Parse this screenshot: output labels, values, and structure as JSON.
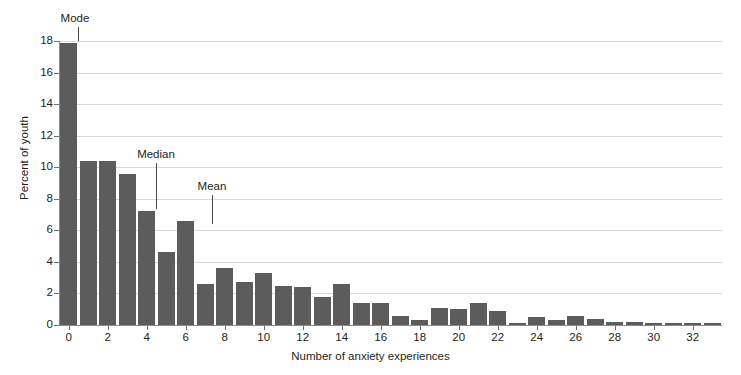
{
  "chart_data": {
    "type": "bar",
    "title": "",
    "xlabel": "Number of anxiety experiences",
    "ylabel": "Percent of youth",
    "categories": [
      0,
      1,
      2,
      3,
      4,
      5,
      6,
      7,
      8,
      9,
      10,
      11,
      12,
      13,
      14,
      15,
      16,
      17,
      18,
      19,
      20,
      21,
      22,
      23,
      24,
      25,
      26,
      27,
      28,
      29,
      30,
      31,
      32,
      33
    ],
    "values": [
      17.9,
      10.4,
      10.4,
      9.6,
      7.2,
      4.6,
      6.6,
      2.6,
      3.6,
      2.7,
      3.3,
      2.5,
      2.4,
      1.8,
      2.6,
      1.4,
      1.4,
      0.6,
      0.3,
      1.1,
      1.0,
      1.4,
      0.9,
      0.1,
      0.5,
      0.3,
      0.6,
      0.35,
      0.2,
      0.2,
      0.15,
      0.15,
      0.15,
      0.12
    ],
    "x_tick_labels": [
      "0",
      "2",
      "4",
      "6",
      "8",
      "10",
      "12",
      "14",
      "16",
      "18",
      "20",
      "22",
      "24",
      "26",
      "28",
      "30",
      "32"
    ],
    "x_tick_values": [
      0,
      2,
      4,
      6,
      8,
      10,
      12,
      14,
      16,
      18,
      20,
      22,
      24,
      26,
      28,
      30,
      32
    ],
    "y_tick_labels": [
      "0",
      "2",
      "4",
      "6",
      "8",
      "10",
      "12",
      "14",
      "16",
      "18"
    ],
    "y_tick_values": [
      0,
      2,
      4,
      6,
      8,
      10,
      12,
      14,
      16,
      18
    ],
    "ylim": [
      0,
      18
    ],
    "xlim": [
      -0.5,
      33.5
    ],
    "grid": true,
    "legend": "none",
    "bar_color": "#5c5c5c",
    "grid_color": "#d9d9d9",
    "axis_color": "#8a8a8a",
    "text_color": "#231f20",
    "background_color": "#ffffff",
    "annotations": [
      {
        "label": "Mode",
        "x_value": 0,
        "label_x_px": 75,
        "label_y_px": 12,
        "line_x_px": 78,
        "line_top_px": 27,
        "line_height_px": 14
      },
      {
        "label": "Median",
        "x_value": 4,
        "label_x_px": 156,
        "label_y_px": 148,
        "line_x_px": 156,
        "line_top_px": 163,
        "line_height_px": 46
      },
      {
        "label": "Mean",
        "x_value": 6,
        "label_x_px": 212,
        "label_y_px": 180,
        "line_x_px": 212,
        "line_top_px": 195,
        "line_height_px": 29
      }
    ],
    "watermark_text": ""
  }
}
